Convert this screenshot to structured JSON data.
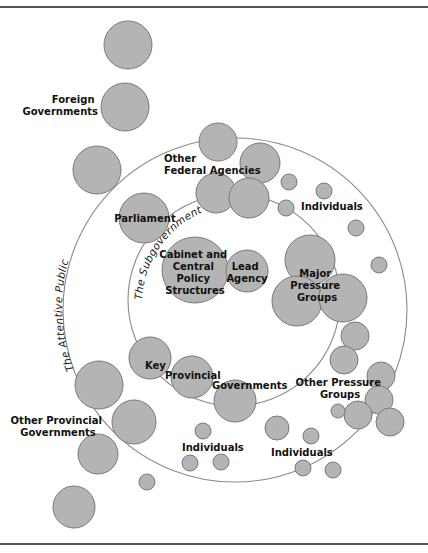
{
  "diagram": {
    "colors": {
      "node_fill": "#b4b4b4",
      "node_stroke": "#7a7a7a",
      "ring_stroke": "#8a8a8a",
      "text": "#111111",
      "rule": "#555555"
    },
    "rings": {
      "outer": {
        "label": "The Attentive Public",
        "cx": 235,
        "cy": 310,
        "r": 172
      },
      "inner": {
        "label": "The Subgovernment",
        "cx": 234,
        "cy": 300,
        "r": 106
      }
    },
    "labels": {
      "foreign_1": "Foreign",
      "foreign_2": "Governments",
      "federal_1": "Other",
      "federal_2": "Federal Agencies",
      "individuals_top": "Individuals",
      "parliament": "Parliament",
      "cabinet_1": "Cabinet and",
      "cabinet_2": "Central",
      "cabinet_3": "Policy",
      "cabinet_4": "Structures",
      "lead_1": "Lead",
      "lead_2": "Agency",
      "major_1": "Major",
      "major_2": "Pressure",
      "major_3": "Groups",
      "key": "Key",
      "provincial": "Provincial",
      "governments": "Governments",
      "other_pressure_1": "Other Pressure",
      "other_pressure_2": "Groups",
      "other_prov_1": "Other Provincial",
      "other_prov_2": "Governments",
      "individuals_bl": "Individuals",
      "individuals_br": "Individuals"
    },
    "nodes": [
      {
        "name": "top-circle",
        "cx": 128,
        "cy": 45,
        "r": 24
      },
      {
        "name": "foreign-governments",
        "cx": 125,
        "cy": 107,
        "r": 24
      },
      {
        "name": "left-circle",
        "cx": 97,
        "cy": 170,
        "r": 24
      },
      {
        "name": "federal-agency-1",
        "cx": 218,
        "cy": 142,
        "r": 19
      },
      {
        "name": "federal-agency-2",
        "cx": 260,
        "cy": 163,
        "r": 20
      },
      {
        "name": "federal-agency-3",
        "cx": 216,
        "cy": 193,
        "r": 20
      },
      {
        "name": "federal-agency-4",
        "cx": 249,
        "cy": 198,
        "r": 20
      },
      {
        "name": "individual-1",
        "cx": 289,
        "cy": 182,
        "r": 8
      },
      {
        "name": "individual-2",
        "cx": 324,
        "cy": 191,
        "r": 8
      },
      {
        "name": "individual-3",
        "cx": 286,
        "cy": 208,
        "r": 8
      },
      {
        "name": "individual-4",
        "cx": 356,
        "cy": 228,
        "r": 8
      },
      {
        "name": "individual-5",
        "cx": 379,
        "cy": 265,
        "r": 8
      },
      {
        "name": "parliament",
        "cx": 144,
        "cy": 218,
        "r": 25
      },
      {
        "name": "cabinet",
        "cx": 195,
        "cy": 270,
        "r": 33
      },
      {
        "name": "lead-agency",
        "cx": 247,
        "cy": 271,
        "r": 21
      },
      {
        "name": "major-pressure-1",
        "cx": 310,
        "cy": 260,
        "r": 25
      },
      {
        "name": "major-pressure-2",
        "cx": 297,
        "cy": 301,
        "r": 25
      },
      {
        "name": "major-pressure-3",
        "cx": 343,
        "cy": 298,
        "r": 24
      },
      {
        "name": "other-pressure-1",
        "cx": 355,
        "cy": 336,
        "r": 14
      },
      {
        "name": "other-pressure-2",
        "cx": 344,
        "cy": 360,
        "r": 14
      },
      {
        "name": "other-pressure-3",
        "cx": 381,
        "cy": 376,
        "r": 14
      },
      {
        "name": "other-pressure-4",
        "cx": 379,
        "cy": 400,
        "r": 14
      },
      {
        "name": "other-pressure-5",
        "cx": 358,
        "cy": 415,
        "r": 14
      },
      {
        "name": "other-pressure-6",
        "cx": 338,
        "cy": 411,
        "r": 7
      },
      {
        "name": "other-pressure-7",
        "cx": 390,
        "cy": 422,
        "r": 14
      },
      {
        "name": "key-provincial-1",
        "cx": 150,
        "cy": 358,
        "r": 21
      },
      {
        "name": "key-provincial-2",
        "cx": 192,
        "cy": 377,
        "r": 21
      },
      {
        "name": "key-provincial-3",
        "cx": 235,
        "cy": 401,
        "r": 21
      },
      {
        "name": "other-provincial-1",
        "cx": 99,
        "cy": 385,
        "r": 24
      },
      {
        "name": "other-provincial-2",
        "cx": 134,
        "cy": 422,
        "r": 22
      },
      {
        "name": "other-provincial-3",
        "cx": 98,
        "cy": 454,
        "r": 20
      },
      {
        "name": "other-provincial-4",
        "cx": 74,
        "cy": 507,
        "r": 21
      },
      {
        "name": "individual-bl-1",
        "cx": 203,
        "cy": 431,
        "r": 8
      },
      {
        "name": "individual-bl-2",
        "cx": 190,
        "cy": 463,
        "r": 8
      },
      {
        "name": "individual-bl-3",
        "cx": 221,
        "cy": 462,
        "r": 8
      },
      {
        "name": "individual-bl-4",
        "cx": 147,
        "cy": 482,
        "r": 8
      },
      {
        "name": "individual-br-1",
        "cx": 277,
        "cy": 428,
        "r": 12
      },
      {
        "name": "individual-br-2",
        "cx": 311,
        "cy": 436,
        "r": 8
      },
      {
        "name": "individual-br-3",
        "cx": 303,
        "cy": 468,
        "r": 8
      },
      {
        "name": "individual-br-4",
        "cx": 333,
        "cy": 470,
        "r": 8
      }
    ]
  }
}
